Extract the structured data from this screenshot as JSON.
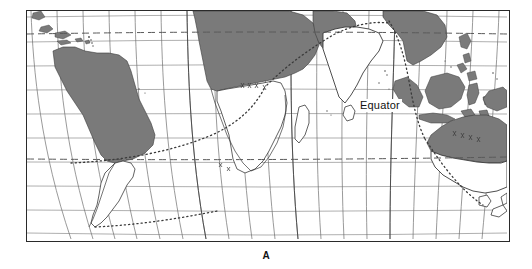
{
  "figure": {
    "caption": "A",
    "type": "world-map",
    "projection": "curved-meridian world map centered on Africa and the Indian Ocean",
    "frame": {
      "border_color": "#2a2a2a",
      "background": "#ffffff"
    }
  },
  "map": {
    "labels": {
      "equator": "Equator"
    },
    "colors": {
      "land_shaded": "#7a7a7a",
      "land_outline": "#3a3a3a",
      "graticule": "#8c8c8c",
      "graticule_dark": "#4a4a4a",
      "tropic_line": "#6e6e6e",
      "route_line": "#4a4a4a",
      "ocean": "#ffffff",
      "frame": "#2a2a2a"
    },
    "graticule": {
      "parallels": 9,
      "meridians": 19,
      "grid_on": true
    },
    "tropic_lines": [
      {
        "name": "tropic-of-cancer",
        "style": "dashed",
        "y": 33
      },
      {
        "name": "tropic-of-capricorn",
        "style": "dashed",
        "y": 157
      }
    ],
    "route_lines": [
      {
        "name": "south-atlantic-route",
        "style": "dotted"
      },
      {
        "name": "indian-ocean-route",
        "style": "dotted"
      },
      {
        "name": "southern-ocean-route",
        "style": "dotted"
      }
    ],
    "landmasses": [
      {
        "name": "south-america",
        "shading": "shaded-north-white-south"
      },
      {
        "name": "caribbean-islands",
        "shading": "shaded"
      },
      {
        "name": "africa",
        "shading": "shaded-north-white-south"
      },
      {
        "name": "madagascar",
        "shading": "white"
      },
      {
        "name": "arabia",
        "shading": "shaded"
      },
      {
        "name": "india",
        "shading": "white"
      },
      {
        "name": "sri-lanka",
        "shading": "white"
      },
      {
        "name": "southeast-asia",
        "shading": "shaded"
      },
      {
        "name": "indonesia",
        "shading": "shaded"
      },
      {
        "name": "philippines",
        "shading": "shaded"
      },
      {
        "name": "new-guinea",
        "shading": "shaded"
      },
      {
        "name": "australia",
        "shading": "shaded-north-white-south"
      },
      {
        "name": "new-zealand",
        "shading": "white"
      }
    ]
  }
}
